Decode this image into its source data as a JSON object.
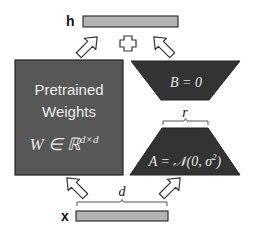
{
  "labels": {
    "output": "h",
    "input": "x",
    "plus": "+",
    "rank": "r",
    "dim": "d"
  },
  "pretrained": {
    "line1": "Pretrained",
    "line2": "Weights",
    "formula_main": "W ∈ ℝ",
    "formula_sup": "d×d"
  },
  "matrix_b": {
    "formula": "B = 0"
  },
  "matrix_a": {
    "formula_prefix": "A = 𝒩(0, σ",
    "formula_sup": "2",
    "formula_suffix": ")"
  },
  "colors": {
    "pretrained_fill": "#575757",
    "adapter_fill": "#333333",
    "bar_fill": "#b3b3b3",
    "outline": "#222222"
  }
}
